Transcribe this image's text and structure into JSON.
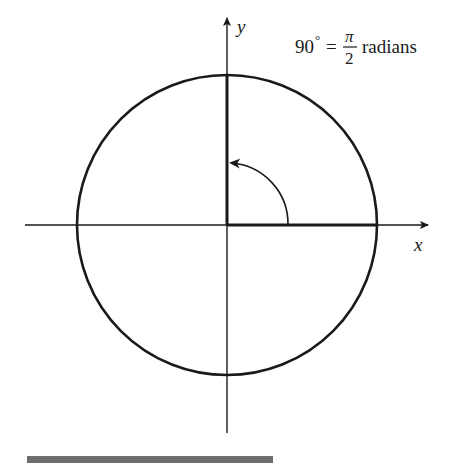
{
  "diagram": {
    "axes": {
      "x_label": "x",
      "y_label": "y"
    },
    "annotation": {
      "degrees": "90",
      "degree_symbol": "°",
      "equals": "=",
      "numerator": "π",
      "denominator": "2",
      "unit": "radians"
    },
    "angle": {
      "degrees": 90,
      "radians_text": "π/2"
    },
    "colors": {
      "stroke": "#1a1a1a",
      "bottom_bar": "#6e6e6e",
      "background": "#ffffff"
    }
  }
}
